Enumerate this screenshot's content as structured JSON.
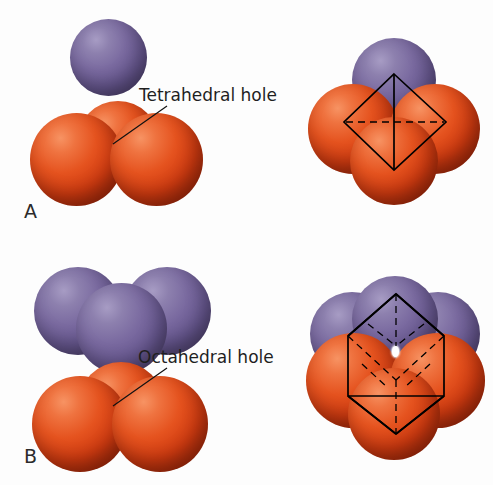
{
  "figure": {
    "background": "#ffffff",
    "sphere_colors": {
      "anion_orange": "#e5531f",
      "cation_purple": "#7a6aa0",
      "wireframe": "#000000",
      "hole_highlight": "#ffffff"
    }
  },
  "panels": [
    {
      "id": "A",
      "label": "A",
      "callout": "Tetrahedral hole",
      "hole_type": "tetrahedral",
      "coordination_number": 4,
      "left_cluster": {
        "purple_count": 1,
        "orange_count": 3,
        "description": "One small purple sphere shown separated above a close-packed group of three orange spheres"
      },
      "right_cluster": {
        "purple_count": 1,
        "orange_count": 4,
        "wireframe": "tetrahedron",
        "description": "Purple sphere nested into the tetrahedral hole of four orange spheres with a tetrahedron outline overlaid"
      }
    },
    {
      "id": "B",
      "label": "B",
      "callout": "Octahedral hole",
      "hole_type": "octahedral",
      "coordination_number": 6,
      "left_cluster": {
        "purple_count": 3,
        "orange_count": 3,
        "description": "A triangular layer of three purple spheres shown separated above a triangular layer of three orange spheres"
      },
      "right_cluster": {
        "purple_count": 3,
        "orange_count": 4,
        "wireframe": "octahedron",
        "hole_visible": true,
        "description": "Two stacked triangular layers forming an octahedral hole, with an octahedron outline overlaid and the hole visible at the centre"
      }
    }
  ]
}
